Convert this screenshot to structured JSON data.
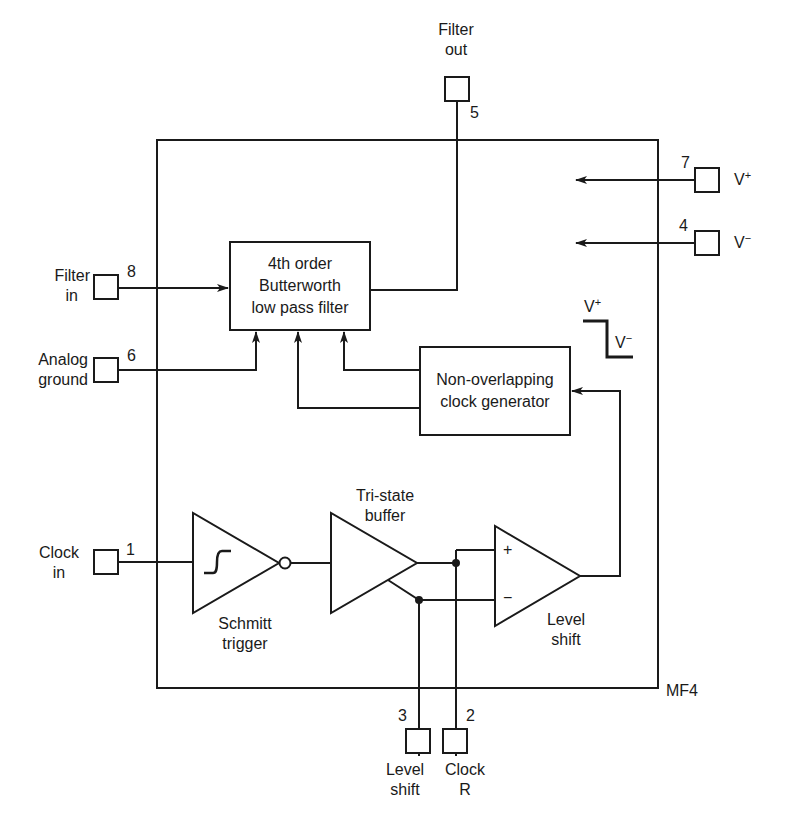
{
  "diagram": {
    "chip_label": "MF4",
    "pins": [
      {
        "number": "1",
        "name_line1": "Clock",
        "name_line2": "in"
      },
      {
        "number": "2",
        "name_line1": "Clock",
        "name_line2": "R"
      },
      {
        "number": "3",
        "name_line1": "Level",
        "name_line2": "shift"
      },
      {
        "number": "4",
        "name": "V",
        "sup": "−"
      },
      {
        "number": "5",
        "name_line1": "Filter",
        "name_line2": "out"
      },
      {
        "number": "6",
        "name_line1": "Analog",
        "name_line2": "ground"
      },
      {
        "number": "7",
        "name": "V",
        "sup": "+"
      },
      {
        "number": "8",
        "name_line1": "Filter",
        "name_line2": "in"
      }
    ],
    "blocks": {
      "filter": {
        "line1": "4th order",
        "line2": "Butterworth",
        "line3": "low pass filter"
      },
      "clockgen": {
        "line1": "Non-overlapping",
        "line2": "clock generator"
      },
      "schmitt": {
        "line1": "Schmitt",
        "line2": "trigger"
      },
      "tristate": {
        "line1": "Tri-state",
        "line2": "buffer"
      },
      "levelshift": {
        "line1": "Level",
        "line2": "shift",
        "plus": "+",
        "minus": "−"
      }
    },
    "level_waveform": {
      "high": "V",
      "high_sup": "+",
      "low": "V",
      "low_sup": "−"
    }
  }
}
